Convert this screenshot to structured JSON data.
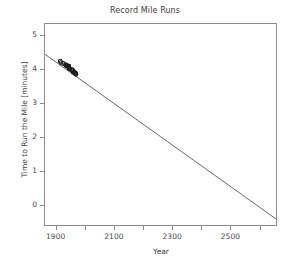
{
  "chart_data": {
    "type": "scatter",
    "title": "Record Mile Runs",
    "xlabel": "Year",
    "ylabel": "Time to Run the Mile [minutes]",
    "xlim": [
      1860,
      2660
    ],
    "ylim": [
      -0.62,
      5.35
    ],
    "xticks": [
      1900,
      2100,
      2300,
      2500
    ],
    "xtick_labels": [
      "1900",
      "2100",
      "2300",
      "2500"
    ],
    "xminor_ticks": [
      2000,
      2200,
      2400,
      2600
    ],
    "yticks": [
      0,
      1,
      2,
      3,
      4,
      5
    ],
    "ytick_labels": [
      "0",
      "1",
      "2",
      "3",
      "4",
      "5"
    ],
    "grid": false,
    "legend": null,
    "marker_color": "#1c1c1c",
    "line_color": "#555555",
    "frame_color": "#8c8c8c",
    "background": "#ffffff",
    "series": [
      {
        "name": "Record mile times",
        "type": "scatter",
        "x": [
          1913,
          1915,
          1923,
          1931,
          1933,
          1934,
          1937,
          1942,
          1942,
          1942,
          1943,
          1944,
          1945,
          1954,
          1954,
          1957,
          1958,
          1962,
          1964,
          1965,
          1966,
          1967
        ],
        "y": [
          4.245,
          4.203,
          4.178,
          4.145,
          4.123,
          4.111,
          4.105,
          4.101,
          4.097,
          4.073,
          4.046,
          4.031,
          4.014,
          3.994,
          3.977,
          3.961,
          3.913,
          3.908,
          3.898,
          3.889,
          3.876,
          3.858
        ]
      },
      {
        "name": "Linear fit (extrapolated)",
        "type": "line",
        "x": [
          1860,
          2660
        ],
        "y": [
          4.45,
          -0.44
        ]
      }
    ]
  },
  "figure": {
    "title": "Record Mile Runs"
  }
}
